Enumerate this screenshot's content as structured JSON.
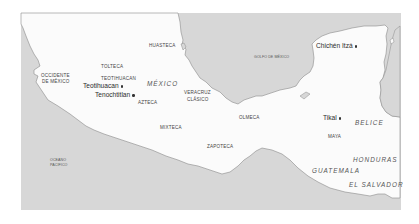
{
  "map": {
    "colors": {
      "sea": "#d7d7d7",
      "land": "#fbfbfb",
      "coast": "#8a8a8a",
      "page": "#ffffff"
    },
    "sites": [
      {
        "name": "Teotihuacan"
      },
      {
        "name": "Tenochtitlan"
      },
      {
        "name": "Chichén Itzá"
      },
      {
        "name": "Tikal"
      }
    ],
    "regions": [
      {
        "name": "HUASTECA"
      },
      {
        "name": "TOLTECA"
      },
      {
        "name": "TEOTIHUACAN"
      },
      {
        "name": "OCCIDENTE"
      },
      {
        "name": "DE MÉXICO"
      },
      {
        "name": "AZTECA"
      },
      {
        "name": "VERACRUZ"
      },
      {
        "name": "CLÁSICO"
      },
      {
        "name": "MIXTECA"
      },
      {
        "name": "OLMECA"
      },
      {
        "name": "ZAPOTECA"
      },
      {
        "name": "MAYA"
      }
    ],
    "countries": [
      {
        "name": "MÉXICO"
      },
      {
        "name": "BELICE"
      },
      {
        "name": "HONDURAS"
      },
      {
        "name": "GUATEMALA"
      },
      {
        "name": "EL SALVADOR"
      }
    ],
    "water_bodies": [
      {
        "name": "GOLFO DE MÉXICO"
      },
      {
        "name": "OCEANO"
      },
      {
        "name": "PACÍFICO"
      }
    ]
  }
}
